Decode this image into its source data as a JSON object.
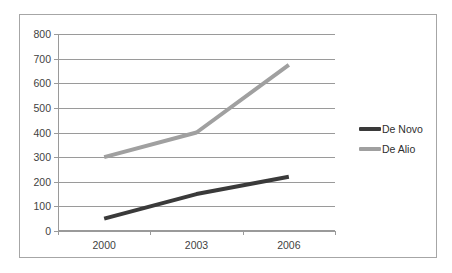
{
  "chart_data": {
    "type": "line",
    "title": "",
    "xlabel": "",
    "ylabel": "",
    "categories": [
      "2000",
      "2003",
      "2006"
    ],
    "x": [
      2000,
      2003,
      2006
    ],
    "series": [
      {
        "name": "De Novo",
        "values": [
          50,
          150,
          220
        ],
        "color": "#3a3a3a"
      },
      {
        "name": "De Alio",
        "values": [
          300,
          400,
          675
        ],
        "color": "#a0a0a0"
      }
    ],
    "ylim": [
      0,
      800
    ],
    "yticks": [
      0,
      100,
      200,
      300,
      400,
      500,
      600,
      700,
      800
    ],
    "ytick_labels": [
      "0",
      "100",
      "200",
      "300",
      "400",
      "500",
      "600",
      "700",
      "800"
    ],
    "xtick_labels": [
      "2000",
      "2003",
      "2006"
    ],
    "grid": true,
    "grid_axis": "y",
    "legend_position": "right",
    "legend": [
      {
        "label": "De Novo",
        "color": "#3a3a3a",
        "marker": "line-swatch-dark"
      },
      {
        "label": "De Alio",
        "color": "#a0a0a0",
        "marker": "line-swatch-gray"
      }
    ],
    "axis_color": "#9a9a9a",
    "border_color": "#a6a6a6",
    "background": "#ffffff"
  }
}
